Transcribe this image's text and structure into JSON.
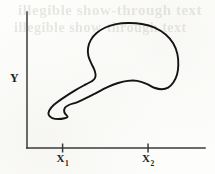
{
  "figure": {
    "background_color": "#fdfdfb",
    "ink_color": "#141414",
    "axis_color": "#3a3a38",
    "bleed_through": {
      "visible": true,
      "legible": false,
      "line1": "illegible show-through text",
      "line2": "illegible show-through text"
    }
  },
  "axes": {
    "y_axis_label": "Y",
    "x_ticks": [
      {
        "name": "x1",
        "base": "X",
        "subscript": "1"
      },
      {
        "name": "x2",
        "base": "X",
        "subscript": "2"
      }
    ]
  },
  "chart_data": {
    "type": "line",
    "title": "",
    "subtitle": "",
    "xlabel": "",
    "ylabel": "Y",
    "grid": false,
    "legend": null,
    "legend_position": "none",
    "xlim": [
      0,
      1
    ],
    "ylim": [
      0,
      1
    ],
    "x_tick_labels": [
      "X₁",
      "X₂"
    ],
    "x_tick_positions": [
      0.2,
      0.68
    ],
    "y_tick_labels": [],
    "y_tick_positions": [],
    "annotations": [],
    "series": [
      {
        "name": "closed region boundary",
        "closed": true,
        "points": [
          [
            0.228,
            0.229
          ],
          [
            0.21,
            0.262
          ],
          [
            0.213,
            0.296
          ],
          [
            0.238,
            0.318
          ],
          [
            0.287,
            0.34
          ],
          [
            0.37,
            0.392
          ],
          [
            0.452,
            0.447
          ],
          [
            0.512,
            0.478
          ],
          [
            0.566,
            0.494
          ],
          [
            0.619,
            0.494
          ],
          [
            0.672,
            0.472
          ],
          [
            0.715,
            0.443
          ],
          [
            0.757,
            0.432
          ],
          [
            0.793,
            0.444
          ],
          [
            0.822,
            0.481
          ],
          [
            0.843,
            0.54
          ],
          [
            0.85,
            0.61
          ],
          [
            0.845,
            0.69
          ],
          [
            0.822,
            0.768
          ],
          [
            0.779,
            0.834
          ],
          [
            0.717,
            0.885
          ],
          [
            0.645,
            0.912
          ],
          [
            0.57,
            0.919
          ],
          [
            0.5,
            0.911
          ],
          [
            0.44,
            0.886
          ],
          [
            0.391,
            0.845
          ],
          [
            0.358,
            0.793
          ],
          [
            0.343,
            0.735
          ],
          [
            0.345,
            0.676
          ],
          [
            0.362,
            0.621
          ],
          [
            0.38,
            0.57
          ],
          [
            0.385,
            0.527
          ],
          [
            0.37,
            0.496
          ],
          [
            0.33,
            0.468
          ],
          [
            0.27,
            0.424
          ],
          [
            0.2,
            0.365
          ],
          [
            0.15,
            0.316
          ],
          [
            0.125,
            0.276
          ],
          [
            0.122,
            0.243
          ],
          [
            0.142,
            0.22
          ],
          [
            0.178,
            0.213
          ],
          [
            0.211,
            0.219
          ],
          [
            0.228,
            0.229
          ]
        ]
      }
    ]
  }
}
